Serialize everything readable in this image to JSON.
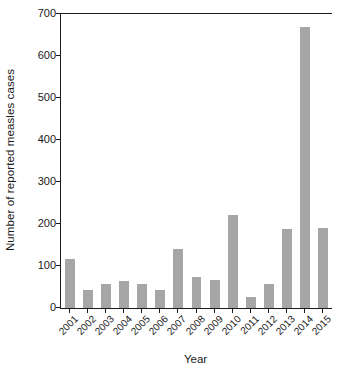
{
  "chart_data": {
    "type": "bar",
    "title": "",
    "subtitle": "",
    "xlabel": "Year",
    "ylabel": "Number of reported measles cases",
    "categories": [
      "2001",
      "2002",
      "2003",
      "2004",
      "2005",
      "2006",
      "2007",
      "2008",
      "2009",
      "2010",
      "2011",
      "2012",
      "2013",
      "2014",
      "2015"
    ],
    "values": [
      117,
      43,
      57,
      65,
      57,
      43,
      140,
      74,
      67,
      222,
      26,
      58,
      189,
      669,
      190
    ],
    "ylim": [
      0,
      700
    ],
    "yticks": [
      0,
      100,
      200,
      300,
      400,
      500,
      600,
      700
    ],
    "ytick_labels": [
      "0",
      "100",
      "200",
      "300",
      "400",
      "500",
      "600",
      "700"
    ],
    "grid": false,
    "legend": null,
    "bar_color": "#a6a6a6",
    "axis_color": "#1a1a1a",
    "background": "#ffffff",
    "annotations": []
  }
}
